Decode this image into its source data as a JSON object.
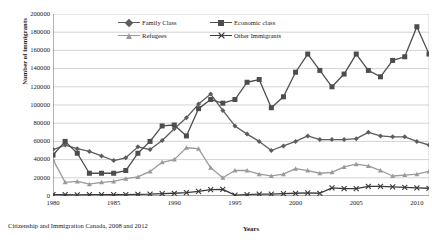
{
  "axes": {
    "ylabel": "Number of immigrants",
    "xlabel": "Years",
    "yticks": [
      "200000",
      "180000",
      "160000",
      "140000",
      "120000",
      "100000",
      "80000",
      "60000",
      "40000",
      "20000",
      "0"
    ],
    "xticks": [
      "1980",
      "1985",
      "1990",
      "1995",
      "2000",
      "2005",
      "2010"
    ]
  },
  "caption": "Citizenship and Immigration Canada, 2008 and 2012",
  "legend": [
    {
      "label": "Family Class",
      "color": "#5d5d5d",
      "marker": "diamond"
    },
    {
      "label": "Economic class",
      "color": "#4d4d4d",
      "marker": "square"
    },
    {
      "label": "Refugees",
      "color": "#9a9a9a",
      "marker": "triangle"
    },
    {
      "label": "Other Immigrants",
      "color": "#3a3a3a",
      "marker": "x"
    }
  ],
  "chart_data": {
    "type": "line",
    "title": "",
    "xlabel": "Years",
    "ylabel": "Number of immigrants",
    "xlim": [
      1980,
      2011
    ],
    "ylim": [
      0,
      200000
    ],
    "ytick_step": 20000,
    "grid": true,
    "legend_position": "top-center",
    "source": "Citizenship and Immigration Canada, 2008 and 2012",
    "x": [
      1980,
      1981,
      1982,
      1983,
      1984,
      1985,
      1986,
      1987,
      1988,
      1989,
      1990,
      1991,
      1992,
      1993,
      1994,
      1995,
      1996,
      1997,
      1998,
      1999,
      2000,
      2001,
      2002,
      2003,
      2004,
      2005,
      2006,
      2007,
      2008,
      2009,
      2010,
      2011
    ],
    "series": [
      {
        "name": "Family Class",
        "color": "#5d5d5d",
        "marker": "diamond",
        "values": [
          51000,
          56000,
          52000,
          49000,
          44000,
          39000,
          42000,
          54000,
          51000,
          61000,
          74000,
          86000,
          101000,
          112000,
          94000,
          77000,
          68000,
          60000,
          50000,
          55000,
          60000,
          66000,
          62000,
          62000,
          62000,
          63000,
          70000,
          66000,
          65000,
          65000,
          60000,
          56000
        ]
      },
      {
        "name": "Economic class",
        "color": "#4d4d4d",
        "marker": "square",
        "values": [
          45000,
          60000,
          47000,
          25000,
          25000,
          25000,
          28000,
          47000,
          60000,
          77000,
          78000,
          66000,
          96000,
          106000,
          102000,
          106000,
          125000,
          128000,
          97000,
          109000,
          136000,
          156000,
          138000,
          120000,
          134000,
          156000,
          138000,
          131000,
          149000,
          153000,
          186000,
          156000
        ]
      },
      {
        "name": "Refugees",
        "color": "#9a9a9a",
        "marker": "triangle",
        "values": [
          40000,
          15000,
          16000,
          13000,
          15000,
          16000,
          19000,
          21000,
          27000,
          37000,
          40000,
          53000,
          52000,
          31000,
          20000,
          28000,
          28000,
          24000,
          22000,
          24000,
          30000,
          28000,
          25000,
          26000,
          32000,
          35000,
          33000,
          28000,
          22000,
          23000,
          24000,
          27000
        ]
      },
      {
        "name": "Other Immigrants",
        "color": "#3a3a3a",
        "marker": "x",
        "values": [
          1500,
          1400,
          1300,
          1500,
          1500,
          1400,
          1600,
          1800,
          2000,
          2500,
          3000,
          3600,
          5000,
          7000,
          7200,
          1000,
          1500,
          2000,
          2000,
          2500,
          3000,
          3500,
          3000,
          9000,
          8000,
          8000,
          10500,
          10500,
          10000,
          9500,
          9000,
          8500
        ]
      }
    ]
  }
}
